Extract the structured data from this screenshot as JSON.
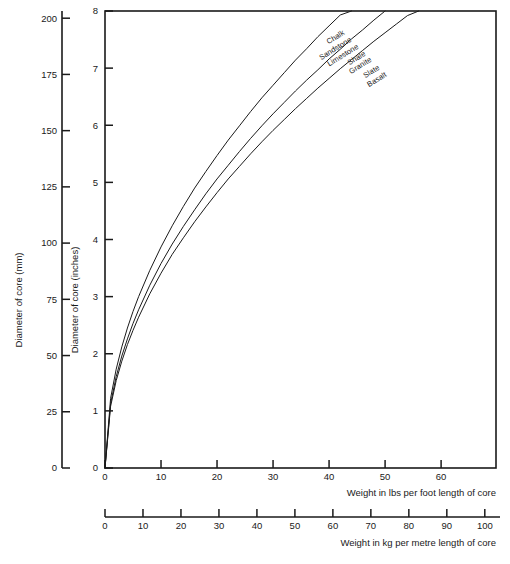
{
  "chart_data": {
    "type": "line",
    "title": "",
    "subtitle": "",
    "grid": false,
    "legend_position": "inline-along-curves",
    "x": [
      0,
      1,
      2,
      3,
      4,
      5,
      6,
      8,
      10,
      12,
      14,
      16,
      18,
      20,
      22,
      24,
      26,
      28,
      30,
      32,
      34,
      36,
      38,
      40,
      42,
      44,
      46,
      48,
      50,
      52,
      54,
      56,
      58,
      60,
      62,
      64,
      66,
      68,
      70
    ],
    "primary_y": {
      "label": "Diameter of core (inches)",
      "unit": "inches",
      "ylim": [
        0,
        8
      ],
      "ticks": [
        0,
        1,
        2,
        3,
        4,
        5,
        6,
        7,
        8
      ],
      "ticklabels": [
        "0",
        "1",
        "2",
        "3",
        "4",
        "5",
        "6",
        "7",
        "8"
      ]
    },
    "secondary_y": {
      "label": "Diameter of core (mm)",
      "unit": "mm",
      "ylim": [
        0,
        203.2
      ],
      "ticks": [
        0,
        25,
        50,
        75,
        100,
        125,
        150,
        175,
        200
      ],
      "ticklabels": [
        "0",
        "25",
        "50",
        "75",
        "100",
        "125",
        "150",
        "175",
        "200"
      ]
    },
    "primary_x": {
      "label": "Weight in lbs per foot length of core",
      "unit": "lbs/ft",
      "xlim": [
        0,
        69.8
      ],
      "ticks": [
        0,
        10,
        20,
        30,
        40,
        50,
        60
      ],
      "ticklabels": [
        "0",
        "10",
        "20",
        "30",
        "40",
        "50",
        "60"
      ]
    },
    "secondary_x": {
      "label": "Weight in kg per metre length of core",
      "unit": "kg/m",
      "xlim": [
        0,
        104
      ],
      "ticks": [
        0,
        10,
        20,
        30,
        40,
        50,
        60,
        70,
        80,
        90,
        100
      ],
      "ticklabels": [
        "0",
        "10",
        "20",
        "30",
        "40",
        "50",
        "60",
        "70",
        "80",
        "90",
        "100"
      ]
    },
    "series": [
      {
        "name": "Chalk / Sandstone",
        "labels": [
          "Chalk",
          "Sandstone"
        ],
        "density_lbs_per_ft_per_in2": 0.845,
        "comment": "upper-left curve; lightest rocks — reaches 8 in at about 54 lbs/ft",
        "points_x": [
          0,
          1,
          2,
          3,
          4,
          5,
          6,
          8,
          10,
          12,
          14,
          16,
          18,
          20,
          22,
          24,
          26,
          28,
          30,
          32,
          34,
          36,
          38,
          40,
          42,
          44,
          46,
          48,
          50,
          52,
          54
        ],
        "points_y": [
          0,
          1.22,
          1.73,
          2.12,
          2.45,
          2.74,
          3.0,
          3.46,
          3.87,
          4.24,
          4.58,
          4.9,
          5.19,
          5.47,
          5.74,
          5.99,
          6.24,
          6.48,
          6.7,
          6.92,
          7.14,
          7.34,
          7.55,
          7.74,
          7.93,
          8.0,
          8.0,
          8.0,
          8.0,
          8.0,
          8.0
        ]
      },
      {
        "name": "Limestone / Shale / Granite",
        "labels": [
          "Limestone",
          "Shale",
          "Granite"
        ],
        "density_lbs_per_ft_per_in2": 0.992,
        "comment": "middle curve; reaches 8 in at about 63.5 lbs/ft",
        "points_x": [
          0,
          1,
          2,
          3,
          4,
          5,
          6,
          8,
          10,
          12,
          14,
          16,
          18,
          20,
          22,
          24,
          26,
          28,
          30,
          32,
          34,
          36,
          38,
          40,
          42,
          44,
          46,
          48,
          50,
          52,
          54,
          56,
          58,
          60,
          62,
          63.5
        ],
        "points_y": [
          0,
          1.13,
          1.6,
          1.96,
          2.26,
          2.53,
          2.77,
          3.2,
          3.58,
          3.92,
          4.23,
          4.52,
          4.8,
          5.06,
          5.3,
          5.54,
          5.77,
          5.99,
          6.2,
          6.4,
          6.6,
          6.79,
          6.97,
          7.16,
          7.33,
          7.51,
          7.67,
          7.84,
          8.0,
          8.0,
          8.0,
          8.0,
          8.0,
          8.0,
          8.0,
          8.0
        ]
      },
      {
        "name": "Slate / Basalt",
        "labels": [
          "Slate",
          "Basalt"
        ],
        "density_lbs_per_ft_per_in2": 1.09,
        "comment": "lower-right curve; densest rocks — reaches 8 in at about 69.8 lbs/ft (top-right corner)",
        "points_x": [
          0,
          1,
          2,
          3,
          4,
          5,
          6,
          8,
          10,
          12,
          14,
          16,
          18,
          20,
          22,
          24,
          26,
          28,
          30,
          32,
          34,
          36,
          38,
          40,
          42,
          44,
          46,
          48,
          50,
          52,
          54,
          56,
          58,
          60,
          62,
          64,
          66,
          68,
          69.8
        ],
        "points_y": [
          0,
          1.08,
          1.53,
          1.87,
          2.16,
          2.41,
          2.64,
          3.05,
          3.41,
          3.74,
          4.03,
          4.31,
          4.57,
          4.82,
          5.06,
          5.28,
          5.5,
          5.71,
          5.91,
          6.1,
          6.29,
          6.47,
          6.65,
          6.82,
          6.99,
          7.15,
          7.31,
          7.47,
          7.62,
          7.77,
          7.92,
          8.0,
          8.0,
          8.0,
          8.0,
          8.0,
          8.0,
          8.0,
          8.0
        ]
      }
    ],
    "curve_labels": [
      "Chalk",
      "Sandstone",
      "Limestone",
      "Shale",
      "Granite",
      "Slate",
      "Basalt"
    ],
    "annotations": []
  },
  "axes": {
    "left_outer_title": "Diameter of core (mm)",
    "left_inner_title": "Diameter of core (inches)",
    "bottom_inner_title": "Weight in lbs per foot length of core",
    "bottom_outer_title": "Weight in kg per metre length of core"
  },
  "colors": {
    "ink": "#1a1a1a",
    "background": "#ffffff"
  }
}
